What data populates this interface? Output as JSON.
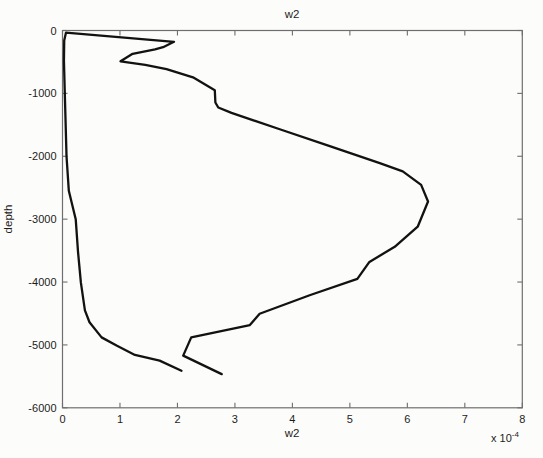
{
  "figure": {
    "background": "#fcfcfa"
  },
  "chart_data": {
    "type": "line",
    "title": "w2",
    "xlabel": "w2",
    "ylabel": "depth",
    "x_multiplier_prefix": "x 10",
    "x_multiplier_exponent": "-4",
    "xlim": [
      0,
      8
    ],
    "ylim": [
      -6000,
      0
    ],
    "xticks": [
      0,
      1,
      2,
      3,
      4,
      5,
      6,
      7,
      8
    ],
    "yticks": [
      0,
      -1000,
      -2000,
      -3000,
      -4000,
      -5000,
      -6000
    ],
    "grid": false,
    "legend": null,
    "axis_color": "#6e6e6e",
    "tick_length_px": 5,
    "line_color": "#121212",
    "line_width": 2.3,
    "x_unit_scale": "1e-4",
    "series": [
      {
        "name": "w2 depth profile",
        "points_format": [
          "w2_x1e-4",
          "depth_m"
        ],
        "points": [
          [
            2.07,
            -5410
          ],
          [
            1.69,
            -5250
          ],
          [
            1.26,
            -5160
          ],
          [
            0.94,
            -5010
          ],
          [
            0.68,
            -4880
          ],
          [
            0.47,
            -4640
          ],
          [
            0.39,
            -4450
          ],
          [
            0.32,
            -4010
          ],
          [
            0.27,
            -3520
          ],
          [
            0.23,
            -3000
          ],
          [
            0.11,
            -2550
          ],
          [
            0.07,
            -2000
          ],
          [
            0.04,
            -1000
          ],
          [
            0.025,
            -480
          ],
          [
            0.03,
            -160
          ],
          [
            0.06,
            -35
          ],
          [
            1.94,
            -180
          ],
          [
            1.75,
            -265
          ],
          [
            1.61,
            -300
          ],
          [
            1.22,
            -370
          ],
          [
            1.01,
            -490
          ],
          [
            1.44,
            -545
          ],
          [
            1.81,
            -615
          ],
          [
            2.27,
            -745
          ],
          [
            2.65,
            -950
          ],
          [
            2.66,
            -1145
          ],
          [
            2.71,
            -1225
          ],
          [
            2.94,
            -1310
          ],
          [
            3.78,
            -1570
          ],
          [
            4.65,
            -1840
          ],
          [
            5.52,
            -2110
          ],
          [
            5.92,
            -2240
          ],
          [
            6.24,
            -2455
          ],
          [
            6.36,
            -2720
          ],
          [
            6.18,
            -3120
          ],
          [
            5.78,
            -3440
          ],
          [
            5.34,
            -3680
          ],
          [
            5.13,
            -3950
          ],
          [
            4.3,
            -4210
          ],
          [
            3.43,
            -4505
          ],
          [
            3.26,
            -4685
          ],
          [
            2.24,
            -4880
          ],
          [
            2.1,
            -5170
          ],
          [
            2.77,
            -5465
          ]
        ]
      }
    ],
    "plot_box_px": {
      "left": 62.5,
      "right": 522.3,
      "top": 30.5,
      "bottom": 407.8
    }
  }
}
